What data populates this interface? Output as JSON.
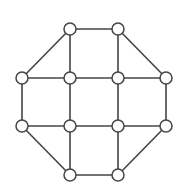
{
  "diagram": {
    "type": "graph",
    "colors": {
      "stroke": "#444444",
      "node_fill": "#ffffff",
      "background": "#ffffff"
    },
    "node_radius": 6,
    "nodes": [
      {
        "id": "n0",
        "x": 70,
        "y": 29
      },
      {
        "id": "n1",
        "x": 118,
        "y": 29
      },
      {
        "id": "n2",
        "x": 22,
        "y": 78
      },
      {
        "id": "n3",
        "x": 70,
        "y": 78
      },
      {
        "id": "n4",
        "x": 118,
        "y": 78
      },
      {
        "id": "n5",
        "x": 166,
        "y": 78
      },
      {
        "id": "n6",
        "x": 22,
        "y": 126
      },
      {
        "id": "n7",
        "x": 70,
        "y": 126
      },
      {
        "id": "n8",
        "x": 118,
        "y": 126
      },
      {
        "id": "n9",
        "x": 166,
        "y": 126
      },
      {
        "id": "n10",
        "x": 70,
        "y": 175
      },
      {
        "id": "n11",
        "x": 118,
        "y": 175
      }
    ],
    "edges": [
      [
        "n0",
        "n1"
      ],
      [
        "n0",
        "n2"
      ],
      [
        "n0",
        "n3"
      ],
      [
        "n1",
        "n4"
      ],
      [
        "n1",
        "n5"
      ],
      [
        "n2",
        "n3"
      ],
      [
        "n3",
        "n4"
      ],
      [
        "n4",
        "n5"
      ],
      [
        "n2",
        "n6"
      ],
      [
        "n3",
        "n7"
      ],
      [
        "n4",
        "n8"
      ],
      [
        "n5",
        "n9"
      ],
      [
        "n6",
        "n7"
      ],
      [
        "n7",
        "n8"
      ],
      [
        "n8",
        "n9"
      ],
      [
        "n6",
        "n10"
      ],
      [
        "n7",
        "n10"
      ],
      [
        "n8",
        "n11"
      ],
      [
        "n9",
        "n11"
      ],
      [
        "n10",
        "n11"
      ]
    ]
  }
}
